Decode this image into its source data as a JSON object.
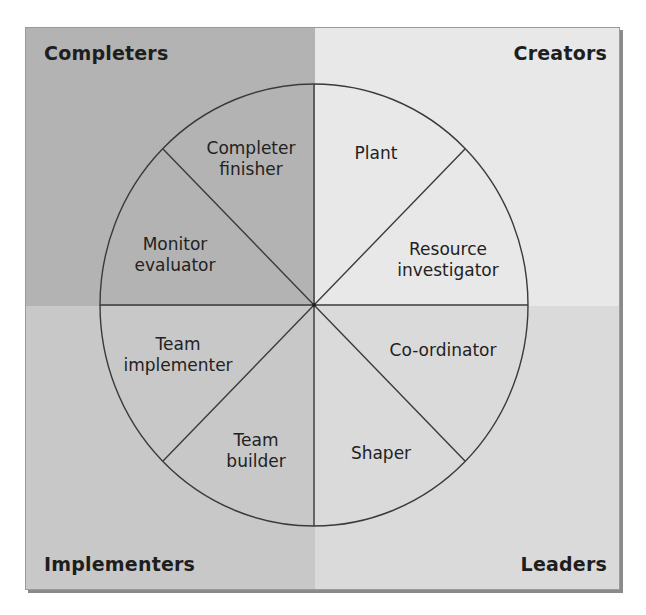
{
  "diagram": {
    "type": "team-role-wheel",
    "quadrants": {
      "top_left": {
        "label": "Completers",
        "color": "#b3b3b3"
      },
      "top_right": {
        "label": "Creators",
        "color": "#e8e8e8"
      },
      "bottom_left": {
        "label": "Implementers",
        "color": "#c8c8c8"
      },
      "bottom_right": {
        "label": "Leaders",
        "color": "#dadada"
      }
    },
    "roles": [
      {
        "line1": "Completer",
        "line2": "finisher",
        "quadrant": "Completers"
      },
      {
        "line1": "Monitor",
        "line2": "evaluator",
        "quadrant": "Completers"
      },
      {
        "line1": "Plant",
        "line2": "",
        "quadrant": "Creators"
      },
      {
        "line1": "Resource",
        "line2": "investigator",
        "quadrant": "Creators"
      },
      {
        "line1": "Co-ordinator",
        "line2": "",
        "quadrant": "Leaders"
      },
      {
        "line1": "Shaper",
        "line2": "",
        "quadrant": "Leaders"
      },
      {
        "line1": "Team",
        "line2": "implementer",
        "quadrant": "Implementers"
      },
      {
        "line1": "Team",
        "line2": "builder",
        "quadrant": "Implementers"
      }
    ],
    "line_color": "#3a3a3a"
  }
}
